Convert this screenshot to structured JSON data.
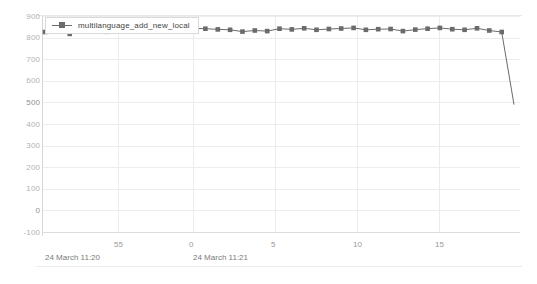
{
  "chart_data": {
    "type": "line",
    "title": "",
    "xlabel": "",
    "ylabel": "",
    "ylim": [
      -100,
      900
    ],
    "y_ticks": [
      900,
      800,
      700,
      600,
      500,
      400,
      300,
      200,
      100,
      0,
      -100
    ],
    "y_tick_labels": [
      "900",
      "800",
      "700",
      "600",
      "500",
      "400",
      "300",
      "200",
      "100",
      "0",
      "-100"
    ],
    "grid": true,
    "legend_position": "top-left",
    "x_tick_labels": [
      "55",
      "0",
      "5",
      "10",
      "15"
    ],
    "x_tick_values": [
      55,
      0,
      5,
      10,
      15
    ],
    "x_group_labels": [
      "24 March 11:20",
      "24 March 11:21"
    ],
    "series": [
      {
        "name": "multilanguage_add_new_local",
        "color": "#6b6b6b",
        "marker": "square",
        "x": [
          55,
          56,
          57,
          58,
          59,
          0,
          1,
          2,
          3,
          4,
          5,
          6,
          7,
          8,
          9,
          10,
          11,
          12,
          13,
          14,
          15,
          16,
          17,
          18,
          19,
          20,
          21,
          22,
          23,
          24,
          25,
          26,
          27,
          28,
          29,
          30,
          31,
          32,
          33
        ],
        "values": [
          826,
          836,
          817,
          853,
          836,
          827,
          841,
          829,
          845,
          844,
          843,
          851,
          843,
          841,
          838,
          836,
          828,
          833,
          830,
          841,
          838,
          843,
          836,
          840,
          842,
          845,
          836,
          839,
          840,
          830,
          837,
          841,
          845,
          839,
          836,
          843,
          833,
          826,
          490
        ]
      }
    ]
  },
  "legend": {
    "entries": [
      {
        "label": "multilanguage_add_new_local"
      }
    ]
  },
  "icons": {
    "legend_marker": "line-square-marker-icon"
  }
}
